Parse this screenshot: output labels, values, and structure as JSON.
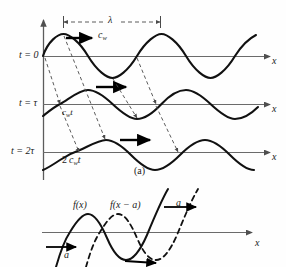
{
  "figure": {
    "caption_a": "(a)",
    "panel_a": {
      "wavelength_label": "λ",
      "speed_label_t0": "c",
      "speed_label_t0_sub": "w",
      "time_labels": [
        {
          "name": "t-equals-0",
          "text": "t = 0"
        },
        {
          "name": "t-equals-tau",
          "text": "t = τ"
        },
        {
          "name": "t-equals-2tau",
          "text": "t = 2τ"
        }
      ],
      "distance_label_tau": "c",
      "distance_label_tau_sub": "w",
      "distance_label_tau_tail": "t",
      "distance_label_2tau_coef": "2",
      "distance_label_2tau": "c",
      "distance_label_2tau_sub": "w",
      "distance_label_2tau_tail": "t",
      "axis_label_row1": "x",
      "axis_label_row2": "x",
      "axis_label_row3": "x"
    },
    "panel_b": {
      "curve_solid_label": "f(x)",
      "curve_dashed_label": "f(x − a)",
      "shift_label_left": "a",
      "shift_label_right": "a",
      "axis_label": "x"
    },
    "colors": {
      "curve": "#111111",
      "axis": "#5c5c5c",
      "dashed": "#4a4a4a",
      "arrow": "#000000",
      "background": "#ffffff"
    }
  }
}
